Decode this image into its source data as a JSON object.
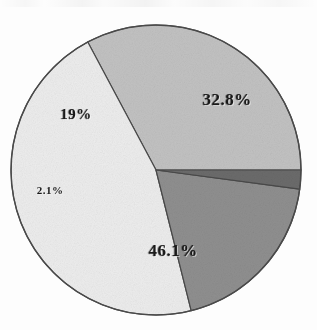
{
  "chart_data": {
    "type": "pie",
    "title": "",
    "subtitle": "",
    "xlabel": "",
    "ylabel": "",
    "legend": "none",
    "grid": false,
    "start_angle_deg": 0,
    "direction": "counterclockwise",
    "units": "percent",
    "total": "100%",
    "categories": [
      "32.8%",
      "46.1%",
      "19%",
      "2.1%"
    ],
    "values": [
      32.8,
      46.1,
      19.0,
      2.1
    ],
    "slices": [
      {
        "label": "32.8%",
        "value": 32.8,
        "color": "#c2c2c2",
        "label_x": 227,
        "label_y": 100,
        "font_size": 17
      },
      {
        "label": "46.1%",
        "value": 46.1,
        "color": "#ededed",
        "label_x": 173,
        "label_y": 251,
        "font_size": 17
      },
      {
        "label": "19%",
        "value": 19.0,
        "color": "#8f8f8f",
        "label_x": 76,
        "label_y": 114,
        "font_size": 15
      },
      {
        "label": "2.1%",
        "value": 2.1,
        "color": "#6b6b6b",
        "label_x": 50,
        "label_y": 190,
        "font_size": 11
      }
    ],
    "geometry": {
      "center_x": 156,
      "center_y": 170,
      "radius": 145
    },
    "style": {
      "background": "#fdfdfd",
      "outline_color": "#4a4a4a",
      "outline_width": 1.2,
      "label_color": "#1a1a1a"
    }
  }
}
